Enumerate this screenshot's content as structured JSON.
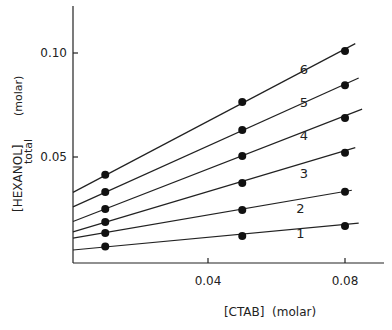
{
  "chart_data": {
    "type": "line",
    "title": "",
    "xlabel": "[CTAB]  (molar)",
    "ylabel": "[HEXANOL]",
    "ylabel_subscript": "total",
    "ylabel_unit": "(molar)",
    "xlim": [
      0,
      0.086
    ],
    "ylim": [
      0,
      0.12
    ],
    "x_ticks": [
      0.04,
      0.08
    ],
    "x_tick_labels": [
      "0.04",
      "0.08"
    ],
    "y_ticks": [
      0.05,
      0.1
    ],
    "y_tick_labels": [
      "0.05",
      "0.10"
    ],
    "grid": false,
    "legend": "none (lines labeled 1-6 inline)",
    "x": [
      0.01,
      0.05,
      0.08
    ],
    "series": [
      {
        "name": "1",
        "values": [
          0.007,
          0.012,
          0.0168
        ],
        "line_x": [
          0,
          0.084
        ],
        "line_y": [
          0.0053,
          0.0182
        ]
      },
      {
        "name": "2",
        "values": [
          0.0135,
          0.0245,
          0.0333
        ],
        "line_x": [
          0,
          0.082
        ],
        "line_y": [
          0.011,
          0.034
        ]
      },
      {
        "name": "3",
        "values": [
          0.0188,
          0.0375,
          0.052
        ],
        "line_x": [
          0,
          0.083
        ],
        "line_y": [
          0.014,
          0.0545
        ]
      },
      {
        "name": "4",
        "values": [
          0.025,
          0.0505,
          0.0688
        ],
        "line_x": [
          0,
          0.085
        ],
        "line_y": [
          0.019,
          0.073
        ]
      },
      {
        "name": "5",
        "values": [
          0.0332,
          0.063,
          0.0845
        ],
        "line_x": [
          0,
          0.084
        ],
        "line_y": [
          0.026,
          0.088
        ]
      },
      {
        "name": "6",
        "values": [
          0.0415,
          0.0765,
          0.101
        ],
        "line_x": [
          0,
          0.083
        ],
        "line_y": [
          0.033,
          0.1045
        ]
      }
    ],
    "line_labels": [
      {
        "text": "1",
        "x": 0.067,
        "y": 0.011
      },
      {
        "text": "2",
        "x": 0.067,
        "y": 0.023
      },
      {
        "text": "3",
        "x": 0.068,
        "y": 0.04
      },
      {
        "text": "4",
        "x": 0.068,
        "y": 0.058
      },
      {
        "text": "5",
        "x": 0.068,
        "y": 0.074
      },
      {
        "text": "6",
        "x": 0.068,
        "y": 0.09
      }
    ]
  }
}
